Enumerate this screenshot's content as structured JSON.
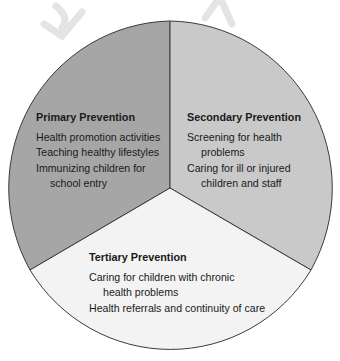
{
  "diagram": {
    "type": "three-segment circle",
    "colors": {
      "primary": "#a6a6a6",
      "secondary": "#c9c9c9",
      "tertiary": "#f3f3f3",
      "outline": "#3a3a3a",
      "watermark": "#e6e6e6"
    },
    "segments": [
      {
        "title": "Primary Prevention",
        "lines": [
          {
            "text": "Health promotion activities",
            "indent": false
          },
          {
            "text": "Teaching healthy lifestyles",
            "indent": false
          },
          {
            "text": "Immunizing children for",
            "indent": false
          },
          {
            "text": "school entry",
            "indent": true
          }
        ]
      },
      {
        "title": "Secondary Prevention",
        "lines": [
          {
            "text": "Screening for health",
            "indent": false
          },
          {
            "text": "problems",
            "indent": true
          },
          {
            "text": "Caring for ill or injured",
            "indent": false
          },
          {
            "text": "children and staff",
            "indent": true
          }
        ]
      },
      {
        "title": "Tertiary Prevention",
        "lines": [
          {
            "text": "Caring for children with chronic",
            "indent": false
          },
          {
            "text": "health problems",
            "indent": true
          },
          {
            "text": "Health referrals and continuity of care",
            "indent": false
          }
        ]
      }
    ]
  }
}
